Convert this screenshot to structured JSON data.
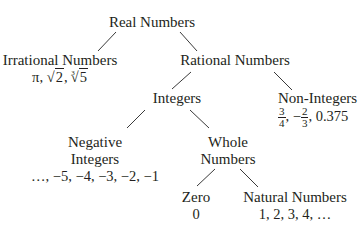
{
  "diagram": {
    "nodes": {
      "real": {
        "label": "Real Numbers"
      },
      "irrational": {
        "label": "Irrational Numbers",
        "examples": {
          "pi": "π",
          "sep": ", ",
          "sqrt2_rad": "2",
          "cbrt5_idx": "3",
          "cbrt5_rad": "5"
        }
      },
      "rational": {
        "label": "Rational Numbers"
      },
      "integers": {
        "label": "Integers"
      },
      "non_integers": {
        "label": "Non-Integers",
        "examples": {
          "f1_num": "3",
          "f1_den": "4",
          "sep1": ", −",
          "f2_num": "2",
          "f2_den": "3",
          "tail": ", 0.375"
        }
      },
      "negative_integers": {
        "label_line1": "Negative",
        "label_line2": "Integers",
        "examples": "…, −5, −4, −3, −2, −1"
      },
      "whole": {
        "label_line1": "Whole",
        "label_line2": "Numbers"
      },
      "zero": {
        "label": "Zero",
        "examples": "0"
      },
      "natural": {
        "label": "Natural Numbers",
        "examples": "1, 2, 3, 4, …"
      }
    },
    "edges": [
      [
        "Real Numbers",
        "Irrational Numbers"
      ],
      [
        "Real Numbers",
        "Rational Numbers"
      ],
      [
        "Rational Numbers",
        "Integers"
      ],
      [
        "Rational Numbers",
        "Non-Integers"
      ],
      [
        "Integers",
        "Negative Integers"
      ],
      [
        "Integers",
        "Whole Numbers"
      ],
      [
        "Whole Numbers",
        "Zero"
      ],
      [
        "Whole Numbers",
        "Natural Numbers"
      ]
    ]
  }
}
